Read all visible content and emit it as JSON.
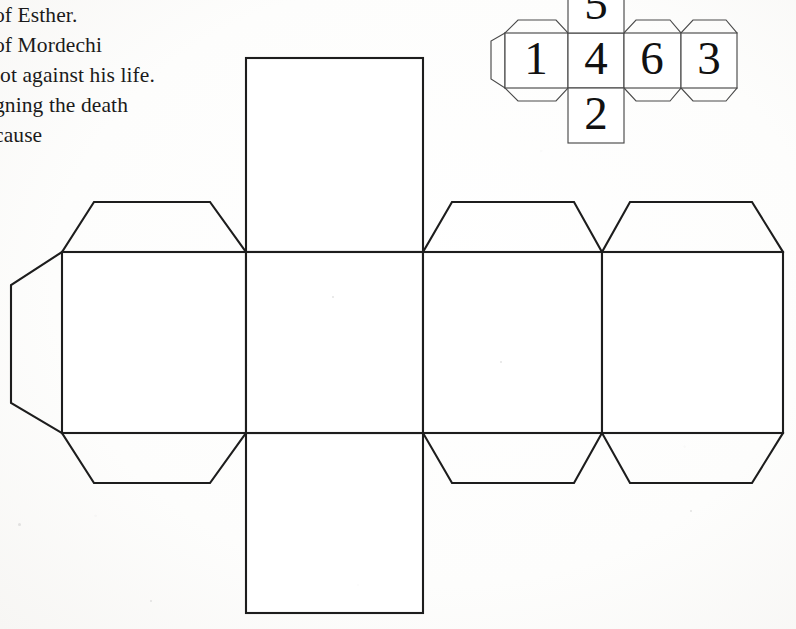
{
  "page": {
    "width": 796,
    "height": 629,
    "background_color": "#ffffff",
    "ink_color": "#1d1d1d",
    "document_type": "scanned-worksheet-cube-net"
  },
  "text_block": {
    "name": "body-text-paragraph",
    "note": "text is cropped by the left page edge; only the visible right fragment of each line is rendered",
    "lines": [
      "of Esther.",
      "of Mordechi",
      "lot against his life.",
      "gning the death",
      "cause"
    ]
  },
  "dice_net_diagram": {
    "title": "dice-number-net",
    "description": "small six-face cube net with numbered faces and glue tabs",
    "row_faces": [
      "1",
      "4",
      "6",
      "3"
    ],
    "top_face": "5",
    "bottom_face": "2",
    "faces": [
      {
        "id": "face-1",
        "value": "1",
        "position": "row-col-1"
      },
      {
        "id": "face-4",
        "value": "4",
        "position": "row-col-2"
      },
      {
        "id": "face-6",
        "value": "6",
        "position": "row-col-3"
      },
      {
        "id": "face-3",
        "value": "3",
        "position": "row-col-4"
      },
      {
        "id": "face-5",
        "value": "5",
        "position": "above-col-2"
      },
      {
        "id": "face-2",
        "value": "2",
        "position": "below-col-2"
      }
    ],
    "tab_count": 7
  },
  "cube_net_template": {
    "title": "large-cube-net-cut-out",
    "description": "large blank cube net: a horizontal strip of four square faces with a fifth face above column two and a sixth face below column two, plus trapezoidal glue tabs and one left pentagonal tab",
    "face_count": 6,
    "faces_blank": true,
    "columns": 4,
    "tabs": {
      "top_trapezoid_tabs": 3,
      "bottom_trapezoid_tabs": 3,
      "left_pentagon_tab": 1
    }
  }
}
